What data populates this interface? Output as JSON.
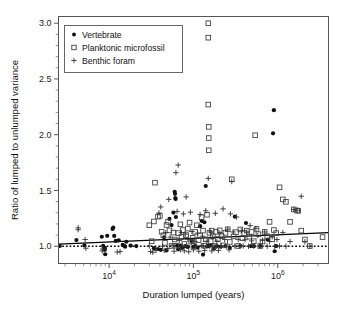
{
  "chart_data": {
    "type": "scatter",
    "title": "",
    "xlabel": "Duration lumped (years)",
    "ylabel": "Ratio of lumped to unlumped variance",
    "x_scale": "log",
    "y_scale": "linear",
    "xlim": [
      2512,
      4000000
    ],
    "ylim": [
      0.845,
      3.06
    ],
    "grid": false,
    "legend_position": "upper-left",
    "x_ticks_major": [
      {
        "value": 10000,
        "label": "10",
        "exponent": "4"
      },
      {
        "value": 100000,
        "label": "10",
        "exponent": "5"
      },
      {
        "value": 1000000,
        "label": "10",
        "exponent": "6"
      }
    ],
    "y_ticks_major": [
      {
        "value": 1.0,
        "label": "1.0"
      },
      {
        "value": 1.5,
        "label": "1.5"
      },
      {
        "value": 2.0,
        "label": "2.0"
      },
      {
        "value": 2.5,
        "label": "2.5"
      },
      {
        "value": 3.0,
        "label": "3.0"
      }
    ],
    "y_ticks_minor": [
      1.1,
      1.2,
      1.3,
      1.4,
      1.6,
      1.7,
      1.8,
      1.9,
      2.1,
      2.2,
      2.3,
      2.4,
      2.6,
      2.7,
      2.8,
      2.9
    ],
    "reference_line": {
      "y": 1.0,
      "style": "dotted",
      "color": "#000000"
    },
    "fit_line": {
      "style": "solid",
      "color": "#000000",
      "x0": 2512,
      "y0": 1.018,
      "x1": 4000000,
      "y1": 1.122
    },
    "series": [
      {
        "name": "Vertebrate",
        "marker": "filled-circle",
        "color": "#111111",
        "points": [
          [
            2600,
            1.002
          ],
          [
            4100,
            1.055
          ],
          [
            5100,
            1.007
          ],
          [
            8200,
            1.085
          ],
          [
            8500,
            1.003
          ],
          [
            8900,
            0.985
          ],
          [
            8900,
            0.968
          ],
          [
            9000,
            0.928
          ],
          [
            9500,
            1.093
          ],
          [
            11000,
            1.155
          ],
          [
            11200,
            1.168
          ],
          [
            11500,
            1.092
          ],
          [
            12000,
            1.047
          ],
          [
            13000,
            1.053
          ],
          [
            14500,
            1.013
          ],
          [
            15200,
            1.002
          ],
          [
            15500,
            0.996
          ],
          [
            16000,
            1.04
          ],
          [
            18000,
            1.006
          ],
          [
            21000,
            1.001
          ],
          [
            34000,
            0.982
          ],
          [
            38000,
            0.975
          ],
          [
            41000,
            0.968
          ],
          [
            45000,
            1.08
          ],
          [
            48000,
            0.962
          ],
          [
            52000,
            1.245
          ],
          [
            55000,
            1.19
          ],
          [
            58000,
            1.302
          ],
          [
            60000,
            1.488
          ],
          [
            60500,
            1.47
          ],
          [
            61000,
            1.432
          ],
          [
            61500,
            1.424
          ],
          [
            62000,
            1.262
          ],
          [
            64000,
            1.004
          ],
          [
            66000,
            0.972
          ],
          [
            70000,
            1.005
          ],
          [
            74000,
            0.986
          ],
          [
            80000,
            1.001
          ],
          [
            86000,
            0.994
          ],
          [
            95000,
            1.047
          ],
          [
            100000,
            0.993
          ],
          [
            105000,
            1.002
          ],
          [
            112000,
            0.988
          ],
          [
            120000,
            1.18
          ],
          [
            125000,
            1.228
          ],
          [
            130000,
            0.925
          ],
          [
            135000,
            1.215
          ],
          [
            140000,
            1.54
          ],
          [
            145000,
            0.998
          ],
          [
            150000,
            1.003
          ],
          [
            160000,
            1.006
          ],
          [
            175000,
            0.978
          ],
          [
            190000,
            1.001
          ],
          [
            210000,
            0.995
          ],
          [
            240000,
            1.002
          ],
          [
            270000,
            0.986
          ],
          [
            310000,
            1.265
          ],
          [
            360000,
            1.003
          ],
          [
            420000,
            1.208
          ],
          [
            480000,
            1.001
          ],
          [
            520000,
            1.0
          ],
          [
            620000,
            1.002
          ],
          [
            760000,
            1.06
          ],
          [
            880000,
            2.012
          ],
          [
            900000,
            2.22
          ],
          [
            920000,
            0.955
          ],
          [
            960000,
            1.001
          ]
        ]
      },
      {
        "name": "Planktonic microfossil",
        "marker": "open-square",
        "color": "#444444",
        "points": [
          [
            30000,
            1.188
          ],
          [
            32000,
            1.045
          ],
          [
            34000,
            1.222
          ],
          [
            35000,
            1.57
          ],
          [
            38000,
            1.265
          ],
          [
            40000,
            1.272
          ],
          [
            42000,
            1.13
          ],
          [
            44000,
            1.098
          ],
          [
            46000,
            1.03
          ],
          [
            48000,
            1.19
          ],
          [
            50000,
            1.218
          ],
          [
            52000,
            1.142
          ],
          [
            55000,
            1.002
          ],
          [
            58000,
            1.122
          ],
          [
            60000,
            1.06
          ],
          [
            63000,
            1.004
          ],
          [
            66000,
            1.118
          ],
          [
            70000,
            1.196
          ],
          [
            72000,
            1.082
          ],
          [
            75000,
            1.145
          ],
          [
            78000,
            1.02
          ],
          [
            82000,
            1.1
          ],
          [
            86000,
            1.158
          ],
          [
            90000,
            1.212
          ],
          [
            94000,
            1.042
          ],
          [
            98000,
            1.075
          ],
          [
            100000,
            1.002
          ],
          [
            105000,
            1.128
          ],
          [
            110000,
            1.188
          ],
          [
            115000,
            1.055
          ],
          [
            120000,
            1.096
          ],
          [
            125000,
            1.26
          ],
          [
            130000,
            1.14
          ],
          [
            135000,
            1.005
          ],
          [
            140000,
            1.062
          ],
          [
            145000,
            1.282
          ],
          [
            150000,
            3.0
          ],
          [
            150000,
            2.87
          ],
          [
            150000,
            2.27
          ],
          [
            152000,
            2.07
          ],
          [
            152000,
            1.97
          ],
          [
            152000,
            1.86
          ],
          [
            155000,
            1.12
          ],
          [
            160000,
            1.045
          ],
          [
            165000,
            1.14
          ],
          [
            170000,
            1.09
          ],
          [
            178000,
            1.002
          ],
          [
            185000,
            1.128
          ],
          [
            195000,
            1.064
          ],
          [
            205000,
            1.142
          ],
          [
            215000,
            1.09
          ],
          [
            225000,
            1.008
          ],
          [
            240000,
            1.12
          ],
          [
            255000,
            1.152
          ],
          [
            270000,
            1.038
          ],
          [
            285000,
            1.6
          ],
          [
            300000,
            1.088
          ],
          [
            320000,
            1.126
          ],
          [
            340000,
            1.002
          ],
          [
            360000,
            1.15
          ],
          [
            380000,
            1.072
          ],
          [
            400000,
            1.118
          ],
          [
            430000,
            1.14
          ],
          [
            460000,
            1.085
          ],
          [
            490000,
            1.128
          ],
          [
            520000,
            1.045
          ],
          [
            540000,
            1.995
          ],
          [
            560000,
            1.155
          ],
          [
            590000,
            1.108
          ],
          [
            620000,
            1.002
          ],
          [
            660000,
            1.042
          ],
          [
            700000,
            1.128
          ],
          [
            750000,
            1.09
          ],
          [
            800000,
            1.218
          ],
          [
            860000,
            1.062
          ],
          [
            900000,
            1.145
          ],
          [
            960000,
            1.118
          ],
          [
            1050000,
            1.528
          ],
          [
            1150000,
            1.42
          ],
          [
            1250000,
            1.398
          ],
          [
            1400000,
            1.218
          ],
          [
            1550000,
            1.33
          ],
          [
            1700000,
            1.32
          ],
          [
            1750000,
            1.318
          ],
          [
            1900000,
            1.14
          ],
          [
            2100000,
            1.06
          ],
          [
            2400000,
            1.002
          ],
          [
            3400000,
            1.082
          ]
        ]
      },
      {
        "name": "Benthic foram",
        "marker": "plus",
        "color": "#333333",
        "points": [
          [
            4300,
            1.165
          ],
          [
            4300,
            1.148
          ],
          [
            5200,
            1.06
          ],
          [
            5300,
            0.982
          ],
          [
            8300,
            0.958
          ],
          [
            8400,
            0.975
          ],
          [
            12500,
            0.948
          ],
          [
            13500,
            0.952
          ],
          [
            30000,
            1.002
          ],
          [
            31000,
            0.952
          ],
          [
            33000,
            0.945
          ],
          [
            36000,
            0.962
          ],
          [
            39000,
            1.298
          ],
          [
            41000,
            1.352
          ],
          [
            43000,
            1.0
          ],
          [
            45000,
            0.962
          ],
          [
            47000,
            1.122
          ],
          [
            49000,
            0.978
          ],
          [
            51000,
            1.42
          ],
          [
            53000,
            1.082
          ],
          [
            56000,
            1.008
          ],
          [
            59000,
            0.955
          ],
          [
            62000,
            1.66
          ],
          [
            64000,
            1.312
          ],
          [
            66000,
            1.728
          ],
          [
            68000,
            1.052
          ],
          [
            70000,
            0.968
          ],
          [
            72000,
            1.122
          ],
          [
            74000,
            1.002
          ],
          [
            76000,
            1.29
          ],
          [
            78000,
            0.958
          ],
          [
            80000,
            1.108
          ],
          [
            82000,
            1.442
          ],
          [
            84000,
            1.0
          ],
          [
            86000,
            1.062
          ],
          [
            88000,
            0.95
          ],
          [
            92000,
            1.305
          ],
          [
            96000,
            1.132
          ],
          [
            100000,
            0.968
          ],
          [
            104000,
            1.042
          ],
          [
            108000,
            1.0
          ],
          [
            112000,
            1.118
          ],
          [
            116000,
            0.955
          ],
          [
            120000,
            1.285
          ],
          [
            124000,
            1.005
          ],
          [
            128000,
            1.09
          ],
          [
            132000,
            1.0
          ],
          [
            136000,
            0.962
          ],
          [
            140000,
            1.318
          ],
          [
            145000,
            1.045
          ],
          [
            150000,
            1.608
          ],
          [
            155000,
            1.0
          ],
          [
            160000,
            1.128
          ],
          [
            165000,
            0.958
          ],
          [
            170000,
            1.08
          ],
          [
            175000,
            1.002
          ],
          [
            182000,
            1.295
          ],
          [
            190000,
            1.045
          ],
          [
            198000,
            0.962
          ],
          [
            206000,
            1.118
          ],
          [
            215000,
            1.002
          ],
          [
            225000,
            1.335
          ],
          [
            235000,
            1.06
          ],
          [
            245000,
            1.0
          ],
          [
            255000,
            1.152
          ],
          [
            265000,
            0.968
          ],
          [
            275000,
            1.29
          ],
          [
            285000,
            1.58
          ],
          [
            295000,
            1.128
          ],
          [
            310000,
            1.002
          ],
          [
            325000,
            1.262
          ],
          [
            340000,
            1.06
          ],
          [
            355000,
            1.0
          ],
          [
            370000,
            1.138
          ],
          [
            390000,
            1.002
          ],
          [
            410000,
            1.058
          ],
          [
            430000,
            1.128
          ],
          [
            450000,
            1.0
          ],
          [
            470000,
            1.185
          ],
          [
            490000,
            1.048
          ],
          [
            520000,
            1.002
          ],
          [
            550000,
            1.16
          ],
          [
            580000,
            1.095
          ],
          [
            620000,
            1.0
          ],
          [
            660000,
            1.052
          ],
          [
            700000,
            1.128
          ],
          [
            750000,
            1.0
          ],
          [
            800000,
            1.042
          ],
          [
            860000,
            1.085
          ],
          [
            920000,
            1.0
          ],
          [
            980000,
            1.06
          ],
          [
            1050000,
            1.002
          ],
          [
            1150000,
            1.122
          ],
          [
            1250000,
            1.0
          ],
          [
            1400000,
            1.042
          ],
          [
            1550000,
            1.33
          ],
          [
            1700000,
            1.322
          ],
          [
            1900000,
            1.448
          ],
          [
            2100000,
            1.04
          ],
          [
            2400000,
            1.0
          ]
        ]
      }
    ]
  },
  "legend": {
    "items": [
      {
        "label": "Vertebrate",
        "marker": "filled-circle"
      },
      {
        "label": "Planktonic microfossil",
        "marker": "open-square"
      },
      {
        "label": "Benthic foram",
        "marker": "plus"
      }
    ]
  }
}
